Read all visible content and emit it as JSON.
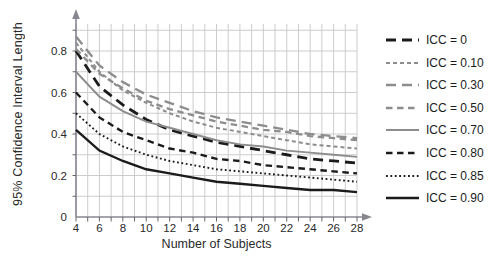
{
  "chart": {
    "ylabel": "95% Confidence Interval Length",
    "xlabel": "Number of Subjects"
  },
  "colors": {
    "black_series": "#1b1b1b",
    "gray_series": "#8d8d8d",
    "grid": "#cccccc",
    "axis": "#87878f",
    "tick": "#666666",
    "text": "#2a2a2a"
  },
  "chart_data": {
    "type": "line",
    "title": "",
    "xlabel": "Number of Subjects",
    "ylabel": "95% Confidence Interval Length",
    "x": [
      4,
      6,
      8,
      10,
      12,
      14,
      16,
      18,
      20,
      22,
      24,
      26,
      28
    ],
    "xlim": [
      4,
      28
    ],
    "ylim": [
      0,
      0.95
    ],
    "x_tick_labels": [
      "4",
      "6",
      "8",
      "10",
      "12",
      "14",
      "16",
      "18",
      "20",
      "22",
      "24",
      "26",
      "28"
    ],
    "y_tick_labels": [
      "0",
      "0.2",
      "0.4",
      "0.6",
      "0.8"
    ],
    "y_tick_values": [
      0,
      0.2,
      0.4,
      0.6,
      0.8
    ],
    "grid": {
      "on": true,
      "x_step": 1,
      "y_step": 0.1
    },
    "legend_position": "right",
    "series": [
      {
        "name": "ICC = 0",
        "color": "#1b1b1b",
        "dash": "10 6",
        "width": 2.8,
        "values": [
          0.8,
          0.63,
          0.54,
          0.47,
          0.42,
          0.39,
          0.36,
          0.34,
          0.32,
          0.3,
          0.28,
          0.27,
          0.26
        ]
      },
      {
        "name": "ICC = 0.10",
        "color": "#8d8d8d",
        "dash": "4 3",
        "width": 2,
        "values": [
          0.84,
          0.7,
          0.61,
          0.55,
          0.5,
          0.46,
          0.43,
          0.41,
          0.39,
          0.37,
          0.35,
          0.34,
          0.33
        ]
      },
      {
        "name": "ICC = 0.30",
        "color": "#8d8d8d",
        "dash": "10 6",
        "width": 2.3,
        "values": [
          0.87,
          0.73,
          0.65,
          0.59,
          0.55,
          0.51,
          0.48,
          0.46,
          0.44,
          0.42,
          0.4,
          0.39,
          0.38
        ]
      },
      {
        "name": "ICC = 0.50",
        "color": "#8d8d8d",
        "dash": "6.5 4.5",
        "width": 2.3,
        "values": [
          0.81,
          0.69,
          0.62,
          0.56,
          0.52,
          0.49,
          0.46,
          0.44,
          0.42,
          0.41,
          0.39,
          0.38,
          0.37
        ]
      },
      {
        "name": "ICC = 0.70",
        "color": "#8d8d8d",
        "dash": "",
        "width": 1.9,
        "values": [
          0.7,
          0.58,
          0.51,
          0.46,
          0.43,
          0.4,
          0.37,
          0.35,
          0.34,
          0.32,
          0.31,
          0.3,
          0.29
        ]
      },
      {
        "name": "ICC = 0.80",
        "color": "#1b1b1b",
        "dash": "6.5 4.5",
        "width": 2.4,
        "values": [
          0.6,
          0.48,
          0.41,
          0.37,
          0.33,
          0.31,
          0.28,
          0.27,
          0.25,
          0.24,
          0.23,
          0.22,
          0.21
        ]
      },
      {
        "name": "ICC = 0.85",
        "color": "#1b1b1b",
        "dash": "1.8 2.6",
        "width": 1.9,
        "values": [
          0.5,
          0.4,
          0.34,
          0.3,
          0.27,
          0.25,
          0.23,
          0.22,
          0.21,
          0.2,
          0.19,
          0.18,
          0.17
        ]
      },
      {
        "name": "ICC = 0.90",
        "color": "#1b1b1b",
        "dash": "",
        "width": 2.4,
        "values": [
          0.42,
          0.32,
          0.27,
          0.23,
          0.21,
          0.19,
          0.17,
          0.16,
          0.15,
          0.14,
          0.13,
          0.13,
          0.12
        ]
      }
    ]
  }
}
